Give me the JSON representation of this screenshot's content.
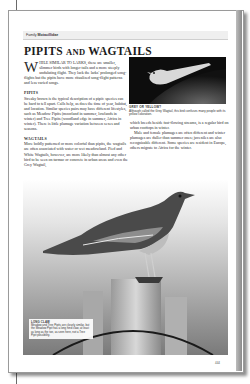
{
  "header": {
    "family_prefix": "Family",
    "family_name": "Motacillidae"
  },
  "title": {
    "part1": "PIPITS",
    "part2": "AND",
    "part3": "WAGTAILS"
  },
  "intro": {
    "dropcap": "W",
    "caps": "HILE SIMILAR TO LARKS,",
    "text": " these are smaller, slimmer birds with longer tails and a more steeply undulating flight. They lack the larks' prolonged song-flights but the pipits have more ritualized song-flight patterns and less varied songs."
  },
  "sections": [
    {
      "heading": "PIPITS",
      "text": "Streaky brown is the typical description of a pipit: species can be hard to tell apart. Calls help, as does the time of year, habitat, and location. Similar species pairs may have different lifestyles, such as Meadow Pipits (moorland in summer, lowlands in winter) and Tree Pipits (woodland edge in summer, Africa in winter). There is little plumage variation between sexes and seasons."
    },
    {
      "heading": "WAGTAILS",
      "text": "More boldly patterned or more colorful than pipits, the wagtails are often associated with water or wet meadowland. Pied and White Wagtails, however, are more likely than almost any other bird to be seen on tarmac or concrete in urban areas and even the Grey Wagtail,"
    }
  ],
  "right_column": {
    "para1": "which breeds beside fast-flowing streams, is a regular bird on urban rooftops in winter.",
    "para2": "Male and female plumages are often different and winter plumages are duller than summer ones; juveniles are also recognizable different. Some species are resident in Europe, others migrate to Africa for the winter."
  },
  "small_photo_caption": {
    "title": "GREY OR YELLOW?",
    "text": "Although called the Grey Wagtail, this bird confuses many people with its yellow coloration."
  },
  "inset_caption": {
    "title": "LONG CLAW",
    "text": "Meadow and Tree Pipits are closely similar, but the Meadow Pipit has a long hind claw, at least as long as the toe, as seen here, not a Tree Pipit possibility."
  },
  "page_number": "444"
}
